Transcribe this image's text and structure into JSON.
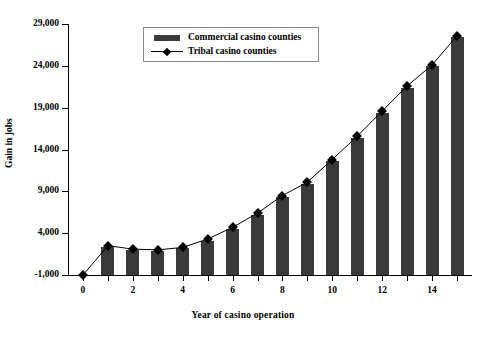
{
  "chart_data": {
    "type": "bar",
    "title": "",
    "xlabel": "Year of casino operation",
    "ylabel": "Gain in jobs",
    "x": [
      0,
      1,
      2,
      3,
      4,
      5,
      6,
      7,
      8,
      9,
      10,
      11,
      12,
      13,
      14,
      15
    ],
    "xlim": [
      -0.6,
      15.6
    ],
    "ylim": [
      -1000,
      29000
    ],
    "ytick_labels": [
      "29,000",
      "24,000",
      "19,000",
      "14,000",
      "9,000",
      "4,000",
      "-1,000"
    ],
    "ytick_values": [
      29000,
      24000,
      19000,
      14000,
      9000,
      4000,
      -1000
    ],
    "xtick_labels": [
      "0",
      "2",
      "4",
      "6",
      "8",
      "10",
      "12",
      "14"
    ],
    "xtick_values": [
      0,
      2,
      4,
      6,
      8,
      10,
      12,
      14
    ],
    "grid": false,
    "legend_position": "top-center",
    "series": [
      {
        "name": "Commercial casino counties",
        "kind": "bar",
        "color": "#3a3a3a",
        "values": [
          0,
          2300,
          2000,
          1900,
          2200,
          3100,
          4500,
          6200,
          8300,
          9900,
          12600,
          15400,
          18400,
          21400,
          24000,
          27500
        ]
      },
      {
        "name": "Tribal casino counties",
        "kind": "line",
        "color": "#000000",
        "marker": "diamond",
        "values": [
          -1000,
          2500,
          2100,
          2000,
          2300,
          3300,
          4700,
          6400,
          8500,
          10100,
          12800,
          15600,
          18600,
          21600,
          24100,
          27600
        ]
      }
    ]
  },
  "legend": {
    "entries": [
      {
        "label": "Commercial casino counties",
        "key": "bar-swatch"
      },
      {
        "label": "Tribal casino counties",
        "key": "line-marker"
      }
    ]
  },
  "axes": {
    "y_title": "Gain in jobs",
    "x_title": "Year of casino operation"
  }
}
